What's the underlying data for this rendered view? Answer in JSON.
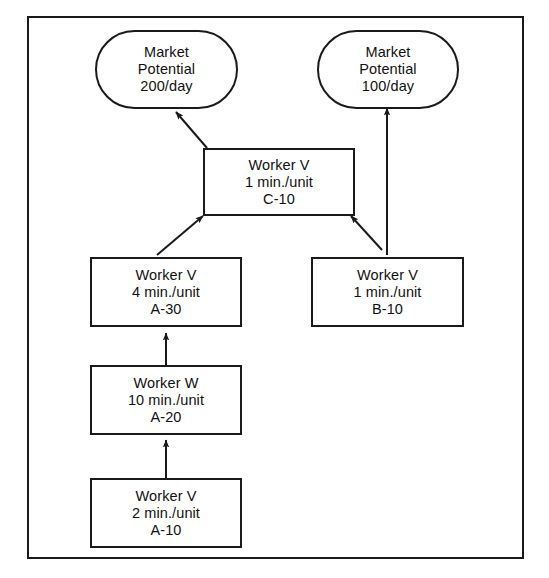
{
  "diagram": {
    "stroke_color": "#1a1a1a",
    "background_color": "#ffffff",
    "nodes": [
      {
        "id": "market-200",
        "shape": "stadium",
        "line1": "Market",
        "line2": "Potential",
        "line3": "200/day"
      },
      {
        "id": "market-100",
        "shape": "stadium",
        "line1": "Market",
        "line2": "Potential",
        "line3": "100/day"
      },
      {
        "id": "op-c10",
        "shape": "box",
        "line1": "Worker V",
        "line2": "1 min./unit",
        "line3": "C-10"
      },
      {
        "id": "op-a30",
        "shape": "box",
        "line1": "Worker V",
        "line2": "4 min./unit",
        "line3": "A-30"
      },
      {
        "id": "op-b10",
        "shape": "box",
        "line1": "Worker V",
        "line2": "1 min./unit",
        "line3": "B-10"
      },
      {
        "id": "op-a20",
        "shape": "box",
        "line1": "Worker W",
        "line2": "10 min./unit",
        "line3": "A-20"
      },
      {
        "id": "op-a10",
        "shape": "box",
        "line1": "Worker V",
        "line2": "2 min./unit",
        "line3": "A-10"
      }
    ],
    "connectors": [
      {
        "id": "a10-to-a20",
        "from": "op-a10",
        "to": "op-a20",
        "style": "vertical-arrow"
      },
      {
        "id": "a20-to-a30",
        "from": "op-a20",
        "to": "op-a30",
        "style": "vertical-arrow"
      },
      {
        "id": "a30-to-c10",
        "from": "op-a30",
        "to": "op-c10",
        "style": "diagonal-arrow"
      },
      {
        "id": "b10-to-c10",
        "from": "op-b10",
        "to": "op-c10",
        "style": "diagonal-arrow"
      },
      {
        "id": "b10-to-market-100",
        "from": "op-b10",
        "to": "market-100",
        "style": "vertical-arrow"
      },
      {
        "id": "c10-to-market-200",
        "from": "op-c10",
        "to": "market-200",
        "style": "diagonal-arrow"
      }
    ]
  }
}
